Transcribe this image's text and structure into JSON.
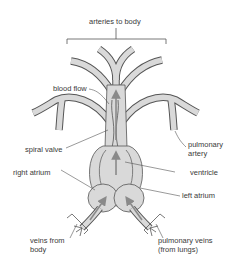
{
  "diagram": {
    "type": "anatomical-diagram",
    "colors": {
      "vessel_fill": "#d9d9d9",
      "outline": "#555555",
      "arrow": "#8a8a8a",
      "leader_line": "#555555",
      "text": "#3a3a3a"
    },
    "labels": {
      "arteries_to_body": "arteries to body",
      "blood_flow": "blood flow",
      "spiral_valve": "spiral valve",
      "pulmonary_artery_line1": "pulmonary",
      "pulmonary_artery_line2": "artery",
      "right_atrium": "right atrium",
      "ventricle": "ventricle",
      "left_atrium": "left atrium",
      "veins_from_body_line1": "veins from",
      "veins_from_body_line2": "body",
      "pulmonary_veins_line1": "pulmonary veins",
      "pulmonary_veins_line2": "(from lungs)"
    }
  }
}
